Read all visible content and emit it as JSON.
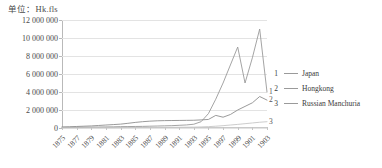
{
  "unit_label": "单位：Hk.fls",
  "legend": {
    "items": [
      {
        "key": "1",
        "label": "Japan"
      },
      {
        "key": "2",
        "label": "Hongkong"
      },
      {
        "key": "3",
        "label": "Russian Manchuria"
      }
    ]
  },
  "end_labels": {
    "japan": "1",
    "hongkong": "2",
    "manchuria": "3"
  },
  "chart_data": {
    "type": "line",
    "title": "单位：Hk.fls",
    "xlabel": "",
    "ylabel": "单位：Hk.fls",
    "ylim": [
      0,
      12000000
    ],
    "ytick_labels": [
      "12 000 000",
      "10 000 000",
      "8 000 000",
      "6 000 000",
      "4 000 000",
      "2 000 000",
      "0"
    ],
    "yticks": [
      12000000,
      10000000,
      8000000,
      6000000,
      4000000,
      2000000,
      0
    ],
    "grid": true,
    "legend_position": "right",
    "xtick_labels": [
      "1875",
      "1877",
      "1879",
      "1881",
      "1883",
      "1885",
      "1887",
      "1889",
      "1891",
      "1893",
      "1895",
      "1897",
      "1899",
      "1901",
      "1903"
    ],
    "x": [
      1875,
      1876,
      1877,
      1878,
      1879,
      1880,
      1881,
      1882,
      1883,
      1884,
      1885,
      1886,
      1887,
      1888,
      1889,
      1890,
      1891,
      1892,
      1893,
      1894,
      1895,
      1896,
      1897,
      1898,
      1899,
      1900,
      1901,
      1902,
      1903
    ],
    "series": [
      {
        "name": "Japan",
        "key": "1",
        "color": "#9a9a9a",
        "values": [
          60000,
          70000,
          80000,
          90000,
          100000,
          110000,
          120000,
          130000,
          150000,
          160000,
          170000,
          180000,
          200000,
          220000,
          240000,
          260000,
          300000,
          340000,
          420000,
          700000,
          1600000,
          3200000,
          5000000,
          7000000,
          9000000,
          5000000,
          7800000,
          11000000,
          4000000
        ]
      },
      {
        "name": "Hongkong",
        "key": "2",
        "color": "#8f8f8f",
        "values": [
          120000,
          140000,
          170000,
          200000,
          230000,
          280000,
          330000,
          380000,
          430000,
          520000,
          620000,
          700000,
          760000,
          800000,
          820000,
          830000,
          840000,
          850000,
          860000,
          900000,
          950000,
          1400000,
          1200000,
          1500000,
          2000000,
          2400000,
          2800000,
          3500000,
          3100000
        ]
      },
      {
        "name": "Russian Manchuria",
        "key": "3",
        "color": "#c6c6c6",
        "values": [
          20000,
          20000,
          25000,
          25000,
          30000,
          30000,
          35000,
          35000,
          40000,
          45000,
          50000,
          55000,
          60000,
          65000,
          70000,
          75000,
          80000,
          90000,
          100000,
          120000,
          150000,
          200000,
          260000,
          330000,
          400000,
          480000,
          560000,
          640000,
          700000
        ]
      }
    ]
  }
}
